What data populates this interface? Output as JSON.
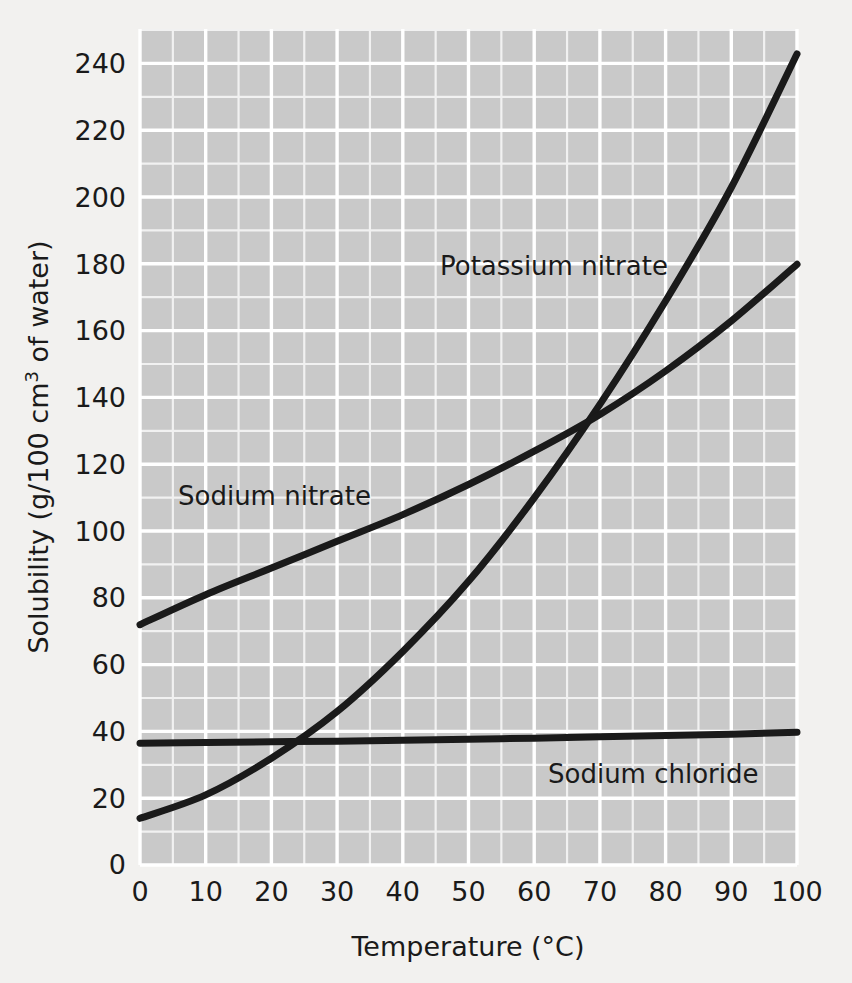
{
  "figure": {
    "background_color": "#f2f1ef",
    "plot_background_color": "#c9c9c9",
    "grid_color": "#ffffff",
    "line_color": "#1a1a1a"
  },
  "chart_data": {
    "type": "line",
    "title": "",
    "xlabel": "Temperature (°C)",
    "ylabel_parts": {
      "before": "Solubility (g/100 cm",
      "sup": "3",
      "after": " of water)"
    },
    "ylabel": "Solubility (g/100 cm3 of water)",
    "xlim": [
      0,
      100
    ],
    "ylim": [
      0,
      250
    ],
    "x_ticks": [
      "0",
      "10",
      "20",
      "30",
      "40",
      "50",
      "60",
      "70",
      "80",
      "90",
      "100"
    ],
    "x_tick_values": [
      0,
      10,
      20,
      30,
      40,
      50,
      60,
      70,
      80,
      90,
      100
    ],
    "y_ticks": [
      "0",
      "20",
      "40",
      "60",
      "80",
      "100",
      "120",
      "140",
      "160",
      "180",
      "200",
      "220",
      "240"
    ],
    "y_tick_values": [
      0,
      20,
      40,
      60,
      80,
      100,
      120,
      140,
      160,
      180,
      200,
      220,
      240
    ],
    "grid": true,
    "grid_minor_x_step": 5,
    "grid_minor_y_step": 10,
    "legend": "inline-labels",
    "x": [
      0,
      10,
      20,
      30,
      40,
      50,
      60,
      70,
      80,
      90,
      100
    ],
    "series": [
      {
        "name": "Potassium nitrate",
        "label": "Potassium nitrate",
        "label_x": 50,
        "label_y": 183,
        "values": [
          14,
          21,
          32,
          46,
          64,
          85,
          110,
          138,
          169,
          203,
          243
        ]
      },
      {
        "name": "Sodium nitrate",
        "label": "Sodium nitrate",
        "label_x": 16,
        "label_y": 116,
        "values": [
          72,
          81,
          89,
          97,
          105,
          114,
          124,
          135,
          148,
          163,
          180
        ]
      },
      {
        "name": "Sodium chloride",
        "label": "Sodium chloride",
        "label_x": 77,
        "label_y": 31,
        "values": [
          36.5,
          36.7,
          36.9,
          37.1,
          37.4,
          37.7,
          38.0,
          38.4,
          38.8,
          39.2,
          39.8
        ]
      }
    ],
    "annotations": [
      {
        "name": "kno3-nacl-crossing",
        "x": 24,
        "y": 37
      },
      {
        "name": "kno3-nano3-crossing",
        "x": 68,
        "y": 132
      }
    ]
  }
}
